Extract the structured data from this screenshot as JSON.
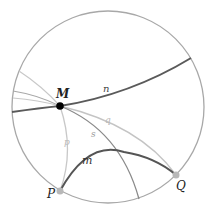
{
  "diagram": {
    "colors": {
      "boundary": "#a8a8a8",
      "dark_line": "#555555",
      "mid_line": "#808080",
      "light_line": "#c2c2c2",
      "point_M": "#000000",
      "ideal_point": "#b8b8b8",
      "label": "#222222",
      "faint_label": "#b0b0b0"
    },
    "points": {
      "M": {
        "label": "M"
      },
      "P": {
        "label": "P"
      },
      "Q": {
        "label": "Q"
      }
    },
    "lines": {
      "n": {
        "label": "n"
      },
      "m": {
        "label": "m"
      },
      "p": {
        "label": "p"
      },
      "q": {
        "label": "q"
      },
      "s": {
        "label": "s"
      }
    }
  }
}
